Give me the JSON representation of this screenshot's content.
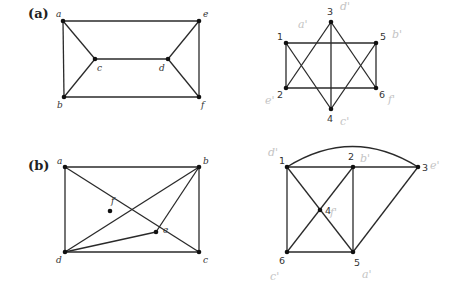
{
  "parts": [
    {
      "id": "a",
      "label": "(a)",
      "label_pos": [
        28,
        18
      ],
      "graphs": [
        {
          "name": "graph-a-left",
          "label_style": "italic",
          "nodes": [
            {
              "id": "a",
              "x": 63,
              "y": 21,
              "lx": 56,
              "ly": 17
            },
            {
              "id": "e",
              "x": 199,
              "y": 21,
              "lx": 203,
              "ly": 17
            },
            {
              "id": "c",
              "x": 95,
              "y": 59,
              "lx": 97,
              "ly": 71
            },
            {
              "id": "d",
              "x": 168,
              "y": 59,
              "lx": 159,
              "ly": 71
            },
            {
              "id": "b",
              "x": 64,
              "y": 97,
              "lx": 57,
              "ly": 108
            },
            {
              "id": "f",
              "x": 199,
              "y": 97,
              "lx": 201,
              "ly": 108
            }
          ],
          "edges": [
            [
              "a",
              "e"
            ],
            [
              "a",
              "b"
            ],
            [
              "e",
              "f"
            ],
            [
              "b",
              "f"
            ],
            [
              "a",
              "c"
            ],
            [
              "b",
              "c"
            ],
            [
              "c",
              "d"
            ],
            [
              "d",
              "e"
            ],
            [
              "d",
              "f"
            ]
          ]
        },
        {
          "name": "graph-a-right",
          "label_style": "number",
          "nodes": [
            {
              "id": "3",
              "x": 331,
              "y": 22,
              "lx": 327,
              "ly": 15
            },
            {
              "id": "1",
              "x": 286,
              "y": 43,
              "lx": 277,
              "ly": 40
            },
            {
              "id": "5",
              "x": 376,
              "y": 43,
              "lx": 380,
              "ly": 40
            },
            {
              "id": "2",
              "x": 286,
              "y": 88,
              "lx": 277,
              "ly": 98
            },
            {
              "id": "6",
              "x": 376,
              "y": 88,
              "lx": 379,
              "ly": 98
            },
            {
              "id": "4",
              "x": 331,
              "y": 109,
              "lx": 327,
              "ly": 122
            }
          ],
          "edges": [
            [
              "1",
              "5"
            ],
            [
              "2",
              "6"
            ],
            [
              "1",
              "2"
            ],
            [
              "5",
              "6"
            ],
            [
              "3",
              "4"
            ],
            [
              "3",
              "2"
            ],
            [
              "3",
              "6"
            ],
            [
              "1",
              "4"
            ],
            [
              "5",
              "4"
            ]
          ],
          "annotations": [
            {
              "text": "a'",
              "x": 298,
              "y": 28
            },
            {
              "text": "d'",
              "x": 340,
              "y": 10
            },
            {
              "text": "b'",
              "x": 392,
              "y": 38
            },
            {
              "text": "e'",
              "x": 265,
              "y": 104
            },
            {
              "text": "f'",
              "x": 388,
              "y": 103
            },
            {
              "text": "c'",
              "x": 340,
              "y": 125
            }
          ]
        }
      ]
    },
    {
      "id": "b",
      "label": "(b)",
      "label_pos": [
        28,
        170
      ],
      "graphs": [
        {
          "name": "graph-b-left",
          "label_style": "italic",
          "nodes": [
            {
              "id": "a",
              "x": 65,
              "y": 167,
              "lx": 57,
              "ly": 164
            },
            {
              "id": "b",
              "x": 199,
              "y": 167,
              "lx": 203,
              "ly": 164
            },
            {
              "id": "f",
              "x": 110,
              "y": 211,
              "lx": 111,
              "ly": 204
            },
            {
              "id": "e",
              "x": 156,
              "y": 232,
              "lx": 163,
              "ly": 233
            },
            {
              "id": "d",
              "x": 65,
              "y": 252,
              "lx": 56,
              "ly": 263
            },
            {
              "id": "c",
              "x": 199,
              "y": 252,
              "lx": 203,
              "ly": 263
            }
          ],
          "edges": [
            [
              "a",
              "b"
            ],
            [
              "a",
              "d"
            ],
            [
              "b",
              "c"
            ],
            [
              "d",
              "c"
            ],
            [
              "a",
              "c"
            ],
            [
              "b",
              "d"
            ],
            [
              "b",
              "e"
            ],
            [
              "d",
              "e"
            ]
          ]
        },
        {
          "name": "graph-b-right",
          "label_style": "number",
          "nodes": [
            {
              "id": "1",
              "x": 287,
              "y": 167,
              "lx": 279,
              "ly": 164
            },
            {
              "id": "2",
              "x": 353,
              "y": 167,
              "lx": 348,
              "ly": 160
            },
            {
              "id": "3",
              "x": 418,
              "y": 167,
              "lx": 422,
              "ly": 171
            },
            {
              "id": "4",
              "x": 320,
              "y": 210,
              "lx": 325,
              "ly": 214
            },
            {
              "id": "6",
              "x": 287,
              "y": 252,
              "lx": 279,
              "ly": 264
            },
            {
              "id": "5",
              "x": 353,
              "y": 252,
              "lx": 354,
              "ly": 266
            }
          ],
          "edges": [
            [
              "1",
              "2"
            ],
            [
              "2",
              "3"
            ],
            [
              "1",
              "6"
            ],
            [
              "6",
              "5"
            ],
            [
              "2",
              "5"
            ],
            [
              "1",
              "5"
            ],
            [
              "2",
              "6"
            ],
            [
              "3",
              "5"
            ]
          ],
          "arc": {
            "from": "1",
            "to": "3",
            "control_y": 126
          },
          "annotations": [
            {
              "text": "d'",
              "x": 268,
              "y": 156
            },
            {
              "text": "b'",
              "x": 360,
              "y": 162
            },
            {
              "text": "e'",
              "x": 430,
              "y": 169
            },
            {
              "text": "f'",
              "x": 330,
              "y": 216
            },
            {
              "text": "c'",
              "x": 270,
              "y": 280
            },
            {
              "text": "a'",
              "x": 362,
              "y": 278
            }
          ]
        }
      ]
    }
  ]
}
